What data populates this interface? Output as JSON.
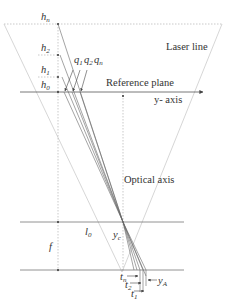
{
  "labels": {
    "laser_line": "Laser line",
    "reference_plane": "Reference plane",
    "y_axis": "y- axis",
    "optical_axis": "Optical axis",
    "h_n": "h",
    "h_n_sub": "n",
    "h_2": "h",
    "h_2_sub": "2",
    "h_1": "h",
    "h_1_sub": "1",
    "h_0": "h",
    "h_0_sub": "0",
    "q_1": "q",
    "q_1_sub": "1",
    "q_2": "q",
    "q_2_sub": "2",
    "q_n": "q",
    "q_n_sub": "n",
    "l_0": "l",
    "l_0_sub": "0",
    "y_c": "y",
    "y_c_sub": "c",
    "f": "f",
    "t_n": "t",
    "t_n_sub": "n",
    "t_2": "t",
    "t_2_sub": "2",
    "t_1": "t",
    "t_1_sub": "1",
    "y_A": "y",
    "y_A_sub": "A"
  },
  "colors": {
    "line": "#555555",
    "faint": "#bbbbbb",
    "text": "#333333"
  }
}
